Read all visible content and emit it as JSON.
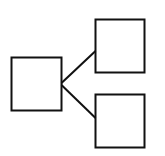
{
  "diagram": {
    "type": "tree",
    "colors": {
      "stroke": "#111111",
      "fill": "#ffffff",
      "background": "#ffffff"
    },
    "nodes": [
      {
        "id": "root",
        "label": "",
        "x": 11,
        "y": 57,
        "w": 51,
        "h": 54
      },
      {
        "id": "child-top",
        "label": "",
        "x": 95,
        "y": 19,
        "w": 50,
        "h": 54
      },
      {
        "id": "child-bottom",
        "label": "",
        "x": 95,
        "y": 94,
        "w": 50,
        "h": 54
      }
    ],
    "edges": [
      {
        "from": "root",
        "to": "child-top"
      },
      {
        "from": "root",
        "to": "child-bottom"
      }
    ]
  }
}
